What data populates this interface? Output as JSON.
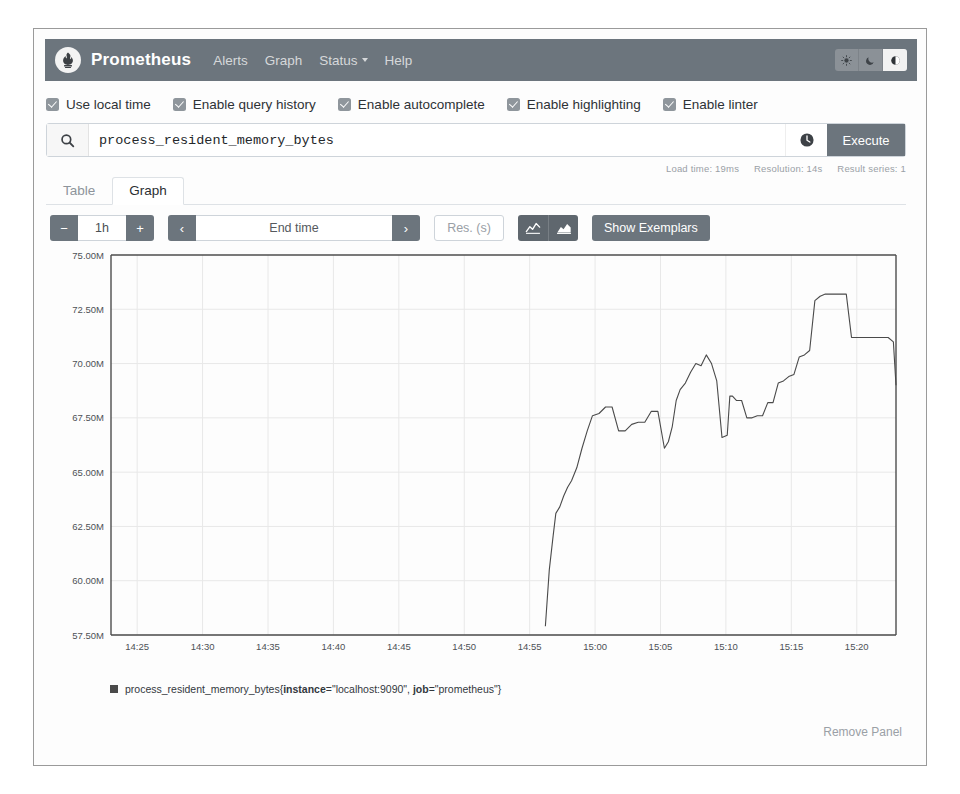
{
  "navbar": {
    "brand": "Prometheus",
    "logo_icon": "prometheus-torch-icon",
    "links": [
      {
        "label": "Alerts",
        "name": "alerts"
      },
      {
        "label": "Graph",
        "name": "graph"
      },
      {
        "label": "Status",
        "name": "status",
        "caret": true
      },
      {
        "label": "Help",
        "name": "help"
      }
    ],
    "theme_buttons": [
      {
        "name": "light-theme",
        "icon": "sun-icon",
        "active": false
      },
      {
        "name": "dark-theme",
        "icon": "moon-icon",
        "active": false
      },
      {
        "name": "auto-theme",
        "icon": "contrast-icon",
        "active": true
      }
    ]
  },
  "options": [
    {
      "label": "Use local time",
      "name": "use-local-time",
      "checked": true
    },
    {
      "label": "Enable query history",
      "name": "enable-query-history",
      "checked": true
    },
    {
      "label": "Enable autocomplete",
      "name": "enable-autocomplete",
      "checked": true
    },
    {
      "label": "Enable highlighting",
      "name": "enable-highlighting",
      "checked": true
    },
    {
      "label": "Enable linter",
      "name": "enable-linter",
      "checked": true
    }
  ],
  "query": {
    "value": "process_resident_memory_bytes",
    "placeholder": "Expression (press Shift+Enter for newlines)",
    "search_icon": "search-icon",
    "history_icon": "history-clock-icon",
    "execute_label": "Execute"
  },
  "meta": {
    "load_time": "Load time: 19ms",
    "resolution": "Resolution: 14s",
    "result_series": "Result series: 1"
  },
  "tabs": [
    {
      "label": "Table",
      "name": "table",
      "active": false
    },
    {
      "label": "Graph",
      "name": "graph",
      "active": true
    }
  ],
  "controls": {
    "decrease_label": "−",
    "range_value": "1h",
    "increase_label": "+",
    "prev_label": "‹",
    "end_time_placeholder": "End time",
    "next_label": "›",
    "res_placeholder": "Res. (s)",
    "chart_type_line_icon": "line-chart-icon",
    "chart_type_stacked_icon": "area-chart-icon",
    "show_exemplars_label": "Show Exemplars"
  },
  "legend": {
    "metric": "process_resident_memory_bytes",
    "open_brace": "{",
    "label1_key": "instance",
    "label1_val": "=\"localhost:9090\", ",
    "label2_key": "job",
    "label2_val": "=\"prometheus\"",
    "close_brace": "}"
  },
  "footer": {
    "remove_panel_label": "Remove Panel"
  },
  "colors": {
    "navbar_bg": "#6c757d",
    "button_bg": "#6c757d",
    "series_line": "#4a4a4a",
    "grid": "#e8e8e8",
    "axis": "#4d4d4d",
    "muted_text": "#9aa0a6"
  },
  "chart_data": {
    "type": "line",
    "title": "",
    "xlabel": "",
    "ylabel": "",
    "grid": true,
    "legend_position": "bottom",
    "ylim": [
      57500000,
      75000000
    ],
    "ytick_labels": [
      "75.00M",
      "72.50M",
      "70.00M",
      "67.50M",
      "65.00M",
      "62.50M",
      "60.00M",
      "57.50M"
    ],
    "ytick_values": [
      75000000,
      72500000,
      70000000,
      67500000,
      65000000,
      62500000,
      60000000,
      57500000
    ],
    "xtick_labels": [
      "14:25",
      "14:30",
      "14:35",
      "14:40",
      "14:45",
      "14:50",
      "14:55",
      "15:00",
      "15:05",
      "15:10",
      "15:15",
      "15:20"
    ],
    "xlim_minutes": [
      863,
      923
    ],
    "series": [
      {
        "name": "process_resident_memory_bytes{instance=\"localhost:9090\", job=\"prometheus\"}",
        "color": "#4a4a4a",
        "x_minutes": [
          896.2,
          896.5,
          896.8,
          897.0,
          897.3,
          897.6,
          897.9,
          898.2,
          898.6,
          899.0,
          899.4,
          899.8,
          900.3,
          900.8,
          901.3,
          901.8,
          902.3,
          902.8,
          903.3,
          903.8,
          904.3,
          904.8,
          905.3,
          905.6,
          905.9,
          906.2,
          906.5,
          906.9,
          907.3,
          907.7,
          908.1,
          908.5,
          908.9,
          909.3,
          909.7,
          910.1,
          910.3,
          910.5,
          910.8,
          911.2,
          911.6,
          912.0,
          912.4,
          912.8,
          913.2,
          913.6,
          914.0,
          914.4,
          914.8,
          915.2,
          915.6,
          916.0,
          916.4,
          916.8,
          917.2,
          917.6,
          918.0,
          918.4,
          918.8,
          919.2,
          919.6,
          920.0,
          920.4,
          920.8,
          921.2,
          921.6,
          922.0,
          922.4,
          922.8,
          923.0
        ],
        "y_values": [
          57900000,
          60500000,
          62100000,
          63100000,
          63400000,
          63900000,
          64300000,
          64600000,
          65200000,
          66100000,
          66900000,
          67600000,
          67700000,
          68000000,
          68000000,
          66900000,
          66900000,
          67200000,
          67300000,
          67300000,
          67800000,
          67800000,
          66100000,
          66400000,
          67100000,
          68300000,
          68800000,
          69100000,
          69600000,
          70000000,
          69900000,
          70400000,
          70000000,
          69200000,
          66600000,
          66700000,
          68500000,
          68500000,
          68300000,
          68300000,
          67500000,
          67500000,
          67600000,
          67600000,
          68200000,
          68200000,
          69100000,
          69200000,
          69400000,
          69500000,
          70300000,
          70400000,
          70600000,
          72900000,
          73100000,
          73200000,
          73200000,
          73200000,
          73200000,
          73200000,
          71200000,
          71200000,
          71200000,
          71200000,
          71200000,
          71200000,
          71200000,
          71200000,
          71000000,
          69000000
        ]
      }
    ]
  }
}
